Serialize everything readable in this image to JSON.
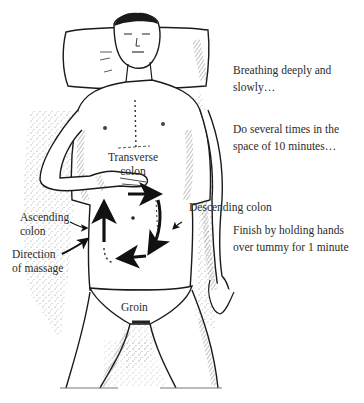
{
  "illustration": {
    "subject": "person lying on back with head on pillow, hand on abdomen performing colon massage",
    "colors": {
      "ink": "#1a1a1a",
      "stipple": "#8a8a8a",
      "background": "#ffffff"
    }
  },
  "labels": {
    "transverse_colon": [
      "Transverse",
      "colon"
    ],
    "ascending_colon": [
      "Ascending",
      "colon"
    ],
    "descending_colon": "Descending colon",
    "direction_of_massage": [
      "Direction",
      "of massage"
    ],
    "groin": "Groin"
  },
  "notes": [
    {
      "lines": [
        "Breathing deeply and",
        "slowly…"
      ]
    },
    {
      "lines": [
        "Do several times in the",
        "space of 10 minutes…"
      ]
    },
    {
      "lines": [
        "Finish by holding hands",
        "over tummy for 1 minute"
      ]
    }
  ]
}
